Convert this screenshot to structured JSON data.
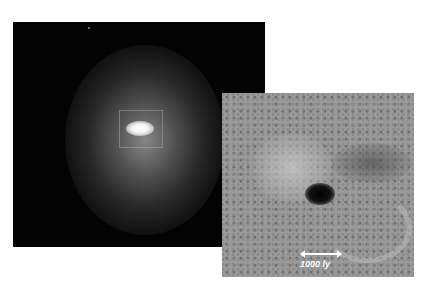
{
  "images": {
    "left": {
      "description": "Galaxy with bright elliptical core and diffuse halo on black background, inset box around core"
    },
    "right": {
      "description": "Grayscale enhanced close-up of galactic nucleus showing dark dust structure and spiral arcs"
    }
  },
  "scale_bar": {
    "label": "1000 ly"
  }
}
